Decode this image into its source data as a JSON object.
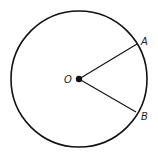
{
  "diagram": {
    "type": "circle-with-central-angle",
    "center": {
      "label": "O",
      "x": 79,
      "y": 79
    },
    "radius": 68,
    "points": [
      {
        "label": "A",
        "x": 137,
        "y": 44,
        "label_x": 141,
        "label_y": 45
      },
      {
        "label": "B",
        "x": 136,
        "y": 112,
        "label_x": 141,
        "label_y": 120
      }
    ],
    "segments": [
      {
        "from": "O",
        "to": "A"
      },
      {
        "from": "O",
        "to": "B"
      }
    ],
    "colors": {
      "stroke": "#111111",
      "background": "#ffffff"
    }
  }
}
